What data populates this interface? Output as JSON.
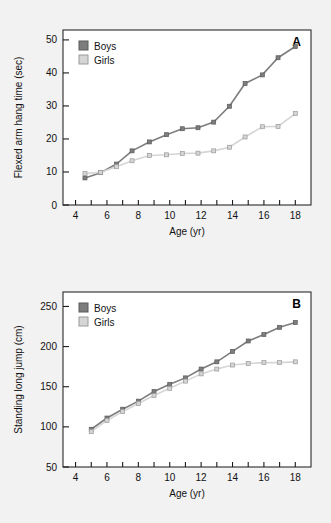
{
  "figure": {
    "background_color": "#f2f2f2",
    "plot_background_color": "#ffffff",
    "axis_color": "#1a1a1a"
  },
  "colors": {
    "boys": "#7d7d7d",
    "girls": "#d5d5d5",
    "boys_border": "#5a5a5a",
    "girls_border": "#9a9a9a"
  },
  "legend": {
    "boys_label": "Boys",
    "girls_label": "Girls"
  },
  "panels": {
    "a": {
      "label": "A"
    },
    "b": {
      "label": "B"
    }
  },
  "chart_data": [
    {
      "type": "line",
      "panel": "A",
      "title": "",
      "xlabel": "Age (yr)",
      "ylabel": "Flexed arm hang time (sec)",
      "xlim": [
        3.2,
        19.0
      ],
      "ylim": [
        0,
        53
      ],
      "xticks": [
        4,
        5,
        6,
        7,
        8,
        9,
        10,
        11,
        12,
        13,
        14,
        15,
        16,
        17,
        18
      ],
      "xticklabels": [
        "4",
        "",
        "6",
        "",
        "8",
        "",
        "10",
        "",
        "12",
        "",
        "14",
        "",
        "16",
        "",
        "18"
      ],
      "yticks": [
        0,
        10,
        20,
        30,
        40,
        50
      ],
      "yticklabels": [
        "0",
        "10",
        "20",
        "30",
        "40",
        "50"
      ],
      "grid": false,
      "legend_position": "top-left",
      "x": [
        4.6,
        5.6,
        6.6,
        7.6,
        8.7,
        9.8,
        10.8,
        11.8,
        12.8,
        13.8,
        14.8,
        15.9,
        16.9,
        18.0
      ],
      "series": [
        {
          "name": "Boys",
          "color": "#7d7d7d",
          "values": [
            8.2,
            9.8,
            12.4,
            16.4,
            19.1,
            21.3,
            23.1,
            23.4,
            25.1,
            29.9,
            36.8,
            39.4,
            44.6,
            48.0
          ]
        },
        {
          "name": "Girls",
          "color": "#d5d5d5",
          "values": [
            9.5,
            9.9,
            11.6,
            13.4,
            15.0,
            15.2,
            15.6,
            15.7,
            16.4,
            17.5,
            20.6,
            23.7,
            23.8,
            27.7
          ]
        }
      ]
    },
    {
      "type": "line",
      "panel": "B",
      "title": "",
      "xlabel": "Age (yr)",
      "ylabel": "Standing long jump (cm)",
      "xlim": [
        3.2,
        19.0
      ],
      "ylim": [
        50,
        268
      ],
      "xticks": [
        4,
        5,
        6,
        7,
        8,
        9,
        10,
        11,
        12,
        13,
        14,
        15,
        16,
        17,
        18
      ],
      "xticklabels": [
        "4",
        "",
        "6",
        "",
        "8",
        "",
        "10",
        "",
        "12",
        "",
        "14",
        "",
        "16",
        "",
        "18"
      ],
      "yticks": [
        50,
        100,
        150,
        200,
        250
      ],
      "yticklabels": [
        "50",
        "100",
        "150",
        "200",
        "250"
      ],
      "grid": false,
      "legend_position": "top-left",
      "x": [
        5,
        6,
        7,
        8,
        9,
        10,
        11,
        12,
        13,
        14,
        15,
        16,
        17,
        18
      ],
      "series": [
        {
          "name": "Boys",
          "color": "#7d7d7d",
          "values": [
            97,
            111,
            122,
            132,
            144,
            153,
            161,
            172,
            181,
            194,
            207,
            215,
            224,
            230
          ]
        },
        {
          "name": "Girls",
          "color": "#d5d5d5",
          "values": [
            94,
            108,
            119,
            129,
            139,
            148,
            157,
            166,
            172,
            177,
            179,
            180,
            180,
            181
          ]
        }
      ]
    }
  ]
}
